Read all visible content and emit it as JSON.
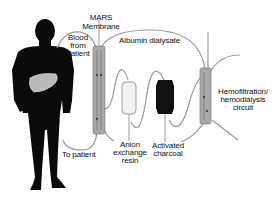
{
  "diagram": {
    "labels": {
      "mars_line1": "MARS",
      "mars_line2": "Membrane",
      "blood_line1": "Blood",
      "blood_line2": "from",
      "blood_line3": "patient",
      "albumin": "Albumin dialysate",
      "to_patient": "To patient",
      "anion_line1": "Anion",
      "anion_line2": "exchange",
      "anion_line3": "resin",
      "charcoal_line1": "Activated",
      "charcoal_line2": "charcoal",
      "hemo_line1": "Hemofiltration/",
      "hemo_line2": "hemodialysis",
      "hemo_line3": "circuit"
    },
    "components": [
      {
        "name": "patient-silhouette",
        "color": "#0a0a0a"
      },
      {
        "name": "liver",
        "color": "#b9b9b9"
      },
      {
        "name": "mars-membrane-column",
        "color": "#a9a9a9"
      },
      {
        "name": "anion-exchange-resin-cartridge",
        "color": "#f2f2f2"
      },
      {
        "name": "activated-charcoal-cartridge",
        "color": "#111111"
      },
      {
        "name": "hemodialysis-filter",
        "color": "#a9a9a9"
      }
    ],
    "tubing_color": "#9a9a9a"
  }
}
